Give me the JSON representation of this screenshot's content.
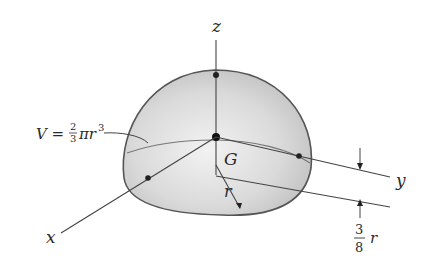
{
  "figure": {
    "labels": {
      "z_axis": "z",
      "x_axis": "x",
      "y_axis": "y",
      "centroid": "G",
      "radius": "r",
      "volume_lhs": "V =",
      "volume_frac_num": "2",
      "volume_frac_den": "3",
      "volume_rest": "πr",
      "volume_exp": "3",
      "offset_frac_num": "3",
      "offset_frac_den": "8",
      "offset_var": "r"
    },
    "colors": {
      "outline": "#555555",
      "fill_light": "#e9e9e9",
      "fill_dark": "#bdbdbd",
      "ink": "#2a2a2a"
    }
  }
}
